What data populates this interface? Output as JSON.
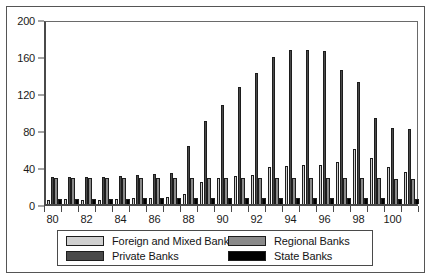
{
  "chart_data": {
    "type": "bar",
    "title": "",
    "subtitle": "",
    "xlabel": "",
    "ylabel": "",
    "grid": false,
    "legend_position": "bottom",
    "ylim": [
      0,
      200
    ],
    "ytick_labels": [
      "0",
      "40",
      "80",
      "120",
      "160",
      "200"
    ],
    "ytick_values": [
      0,
      40,
      80,
      120,
      160,
      200
    ],
    "categories": [
      "80",
      "81",
      "82",
      "83",
      "84",
      "85",
      "86",
      "87",
      "88",
      "89",
      "90",
      "91",
      "92",
      "93",
      "94",
      "95",
      "96",
      "97",
      "98",
      "99",
      "100",
      "101"
    ],
    "xtick_labels": [
      "80",
      "82",
      "84",
      "86",
      "88",
      "90",
      "92",
      "94",
      "96",
      "98",
      "100"
    ],
    "series": [
      {
        "name": "Foreign and Mixed Banks",
        "color": "#d0d0d0",
        "values": [
          4,
          5,
          4,
          4,
          5,
          6,
          7,
          8,
          11,
          24,
          28,
          30,
          31,
          40,
          41,
          42,
          42,
          45,
          59,
          50,
          40,
          35
        ]
      },
      {
        "name": "Private Banks",
        "color": "#4a4a4a",
        "values": [
          29,
          29,
          29,
          29,
          30,
          31,
          32,
          34,
          63,
          90,
          107,
          127,
          142,
          159,
          167,
          166,
          165,
          145,
          132,
          93,
          82,
          81
        ]
      },
      {
        "name": "Regional Banks",
        "color": "#8a8a8a",
        "values": [
          28,
          28,
          28,
          28,
          28,
          28,
          28,
          28,
          28,
          28,
          28,
          28,
          28,
          28,
          28,
          28,
          28,
          28,
          28,
          28,
          27,
          27
        ]
      },
      {
        "name": "State Banks",
        "color": "#000000",
        "values": [
          5,
          5,
          5,
          5,
          5,
          6,
          6,
          6,
          6,
          6,
          6,
          6,
          6,
          6,
          7,
          7,
          7,
          7,
          7,
          6,
          5,
          5
        ]
      }
    ]
  },
  "legend": {
    "items": [
      {
        "label": "Foreign and Mixed Banks",
        "color": "#d0d0d0"
      },
      {
        "label": "Private Banks",
        "color": "#4a4a4a"
      },
      {
        "label": "Regional Banks",
        "color": "#8a8a8a"
      },
      {
        "label": "State Banks",
        "color": "#000000"
      }
    ]
  }
}
